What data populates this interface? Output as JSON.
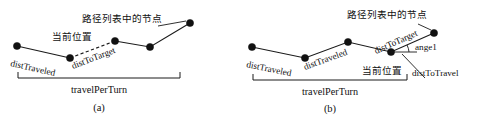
{
  "figure": {
    "panels": [
      {
        "id": "a",
        "caption": "(a)",
        "span_label": "travelPerTurn",
        "node_list_label": "路径列表中的节点",
        "current_pos_label": "当前位置",
        "labels": {
          "dist_traveled": "distTraveled",
          "dist_to_target": "distToTarget"
        },
        "nodes": [
          {
            "x": 17,
            "y": 46
          },
          {
            "x": 70,
            "y": 58
          },
          {
            "x": 115,
            "y": 41
          },
          {
            "x": 150,
            "y": 47
          },
          {
            "x": 190,
            "y": 23
          }
        ],
        "dashed_segment": {
          "from": {
            "x": 70,
            "y": 58
          },
          "to": {
            "x": 115,
            "y": 41
          }
        },
        "bracket": {
          "x1": 18,
          "x2": 180,
          "y": 78,
          "tick": 6
        }
      },
      {
        "id": "b",
        "caption": "(b)",
        "span_label": "travelPerTurn",
        "node_list_label": "路径列表中的节点",
        "current_pos_label": "当前位置",
        "labels": {
          "dist_traveled_1": "distTraveled",
          "dist_traveled_2": "distTraveled",
          "dist_to_target": "distToTarget",
          "dist_to_travel": "distToTravel",
          "angle": "ange1"
        },
        "nodes": [
          {
            "x": 252,
            "y": 47
          },
          {
            "x": 305,
            "y": 58
          },
          {
            "x": 348,
            "y": 42
          },
          {
            "x": 391,
            "y": 52
          },
          {
            "x": 434,
            "y": 33
          }
        ],
        "current_position_node": {
          "x": 391,
          "y": 52
        },
        "bracket": {
          "x1": 253,
          "x2": 407,
          "y": 80,
          "tick": 6
        }
      }
    ],
    "colors": {
      "stroke": "#1a1a1a",
      "node_fill": "#111111",
      "background": "#ffffff"
    }
  }
}
